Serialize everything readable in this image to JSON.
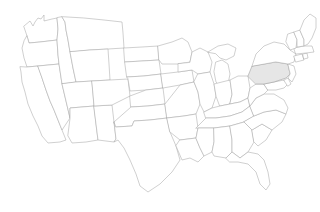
{
  "map": {
    "title": "United States Map",
    "region": "Contiguous United States",
    "projection": "albers-usa",
    "background_color": "#ffffff",
    "border_color": "#a9a9a9",
    "default_fill": "#ffffff",
    "highlight_fill": "#e6e6e6",
    "highlighted_states": [
      "Pennsylvania"
    ],
    "legend": null,
    "labels_visible": false,
    "states": [
      {
        "code": "WA",
        "name": "Washington",
        "highlighted": false
      },
      {
        "code": "OR",
        "name": "Oregon",
        "highlighted": false
      },
      {
        "code": "CA",
        "name": "California",
        "highlighted": false
      },
      {
        "code": "NV",
        "name": "Nevada",
        "highlighted": false
      },
      {
        "code": "ID",
        "name": "Idaho",
        "highlighted": false
      },
      {
        "code": "MT",
        "name": "Montana",
        "highlighted": false
      },
      {
        "code": "WY",
        "name": "Wyoming",
        "highlighted": false
      },
      {
        "code": "UT",
        "name": "Utah",
        "highlighted": false
      },
      {
        "code": "AZ",
        "name": "Arizona",
        "highlighted": false
      },
      {
        "code": "NM",
        "name": "New Mexico",
        "highlighted": false
      },
      {
        "code": "CO",
        "name": "Colorado",
        "highlighted": false
      },
      {
        "code": "ND",
        "name": "North Dakota",
        "highlighted": false
      },
      {
        "code": "SD",
        "name": "South Dakota",
        "highlighted": false
      },
      {
        "code": "NE",
        "name": "Nebraska",
        "highlighted": false
      },
      {
        "code": "KS",
        "name": "Kansas",
        "highlighted": false
      },
      {
        "code": "OK",
        "name": "Oklahoma",
        "highlighted": false
      },
      {
        "code": "TX",
        "name": "Texas",
        "highlighted": false
      },
      {
        "code": "MN",
        "name": "Minnesota",
        "highlighted": false
      },
      {
        "code": "IA",
        "name": "Iowa",
        "highlighted": false
      },
      {
        "code": "MO",
        "name": "Missouri",
        "highlighted": false
      },
      {
        "code": "AR",
        "name": "Arkansas",
        "highlighted": false
      },
      {
        "code": "LA",
        "name": "Louisiana",
        "highlighted": false
      },
      {
        "code": "WI",
        "name": "Wisconsin",
        "highlighted": false
      },
      {
        "code": "IL",
        "name": "Illinois",
        "highlighted": false
      },
      {
        "code": "MI",
        "name": "Michigan",
        "highlighted": false
      },
      {
        "code": "IN",
        "name": "Indiana",
        "highlighted": false
      },
      {
        "code": "OH",
        "name": "Ohio",
        "highlighted": false
      },
      {
        "code": "KY",
        "name": "Kentucky",
        "highlighted": false
      },
      {
        "code": "TN",
        "name": "Tennessee",
        "highlighted": false
      },
      {
        "code": "MS",
        "name": "Mississippi",
        "highlighted": false
      },
      {
        "code": "AL",
        "name": "Alabama",
        "highlighted": false
      },
      {
        "code": "GA",
        "name": "Georgia",
        "highlighted": false
      },
      {
        "code": "FL",
        "name": "Florida",
        "highlighted": false
      },
      {
        "code": "SC",
        "name": "South Carolina",
        "highlighted": false
      },
      {
        "code": "NC",
        "name": "North Carolina",
        "highlighted": false
      },
      {
        "code": "VA",
        "name": "Virginia",
        "highlighted": false
      },
      {
        "code": "WV",
        "name": "West Virginia",
        "highlighted": false
      },
      {
        "code": "MD",
        "name": "Maryland",
        "highlighted": false
      },
      {
        "code": "DE",
        "name": "Delaware",
        "highlighted": false
      },
      {
        "code": "PA",
        "name": "Pennsylvania",
        "highlighted": true
      },
      {
        "code": "NJ",
        "name": "New Jersey",
        "highlighted": false
      },
      {
        "code": "NY",
        "name": "New York",
        "highlighted": false
      },
      {
        "code": "CT",
        "name": "Connecticut",
        "highlighted": false
      },
      {
        "code": "RI",
        "name": "Rhode Island",
        "highlighted": false
      },
      {
        "code": "MA",
        "name": "Massachusetts",
        "highlighted": false
      },
      {
        "code": "VT",
        "name": "Vermont",
        "highlighted": false
      },
      {
        "code": "NH",
        "name": "New Hampshire",
        "highlighted": false
      },
      {
        "code": "ME",
        "name": "Maine",
        "highlighted": false
      }
    ]
  }
}
